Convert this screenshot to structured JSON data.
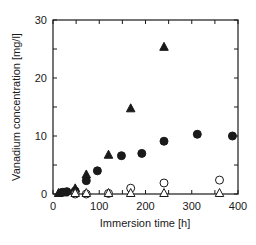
{
  "chart_data": {
    "type": "scatter",
    "title": "",
    "xlabel": "Immersion time  [h]",
    "ylabel": "Vanadium concentration  [mg/l]",
    "xlim": [
      0,
      400
    ],
    "ylim": [
      0,
      30
    ],
    "xticks": [
      0,
      100,
      200,
      300,
      400
    ],
    "yticks": [
      0,
      10,
      20,
      30
    ],
    "x_minor_ticks": [
      50,
      150,
      250,
      350
    ],
    "y_minor_ticks": [
      5,
      15,
      25
    ],
    "grid": false,
    "legend": null,
    "series": [
      {
        "name": "filled-circle",
        "marker": "circle",
        "filled": true,
        "points": [
          [
            20,
            0.3
          ],
          [
            30,
            0.4
          ],
          [
            48,
            0.5
          ],
          [
            72,
            2.3
          ],
          [
            96,
            4.0
          ],
          [
            148,
            6.6
          ],
          [
            192,
            7.0
          ],
          [
            240,
            9.1
          ],
          [
            312,
            10.3
          ],
          [
            388,
            10.0
          ]
        ]
      },
      {
        "name": "filled-triangle",
        "marker": "triangle",
        "filled": true,
        "points": [
          [
            12,
            0.0
          ],
          [
            24,
            0.1
          ],
          [
            48,
            0.8
          ],
          [
            72,
            3.2
          ],
          [
            120,
            6.6
          ],
          [
            168,
            14.6
          ],
          [
            240,
            25.2
          ]
        ]
      },
      {
        "name": "open-circle",
        "marker": "circle",
        "filled": false,
        "points": [
          [
            48,
            0.0
          ],
          [
            72,
            0.0
          ],
          [
            120,
            0.1
          ],
          [
            168,
            1.0
          ],
          [
            240,
            1.9
          ],
          [
            360,
            2.4
          ]
        ]
      },
      {
        "name": "open-triangle",
        "marker": "triangle",
        "filled": false,
        "points": [
          [
            48,
            0.0
          ],
          [
            72,
            0.0
          ],
          [
            120,
            0.0
          ],
          [
            168,
            0.0
          ],
          [
            240,
            0.0
          ],
          [
            360,
            0.0
          ]
        ]
      }
    ]
  },
  "colors": {
    "ink": "#1a1a1a",
    "background": "#ffffff"
  }
}
